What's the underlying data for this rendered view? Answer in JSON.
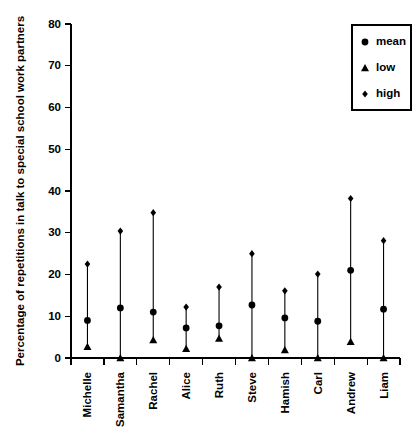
{
  "chart_data": {
    "type": "scatter",
    "title": "",
    "xlabel": "",
    "ylabel": "Percentage of repetitions in talk to special school work partners",
    "ylim": [
      0,
      80
    ],
    "yticks": [
      0,
      10,
      20,
      30,
      40,
      50,
      60,
      70,
      80
    ],
    "grid": false,
    "legend_position": "top-right",
    "categories": [
      "Michelle",
      "Samantha",
      "Rachel",
      "Alice",
      "Ruth",
      "Steve",
      "Hamish",
      "Carl",
      "Andrew",
      "Liam"
    ],
    "series": [
      {
        "name": "mean",
        "marker": "circle",
        "values": [
          9.0,
          12.0,
          11.0,
          7.2,
          7.7,
          12.7,
          9.6,
          8.8,
          21.0,
          11.7
        ]
      },
      {
        "name": "low",
        "marker": "triangle",
        "values": [
          2.7,
          0.0,
          4.3,
          2.2,
          4.7,
          0.0,
          1.9,
          0.0,
          3.9,
          0.0
        ]
      },
      {
        "name": "high",
        "marker": "diamond",
        "values": [
          22.5,
          30.4,
          34.8,
          12.2,
          17.0,
          25.0,
          16.1,
          20.1,
          38.2,
          28.1
        ]
      }
    ]
  },
  "legend": {
    "entries": [
      {
        "label": "mean",
        "marker": "circle"
      },
      {
        "label": "low",
        "marker": "triangle"
      },
      {
        "label": "high",
        "marker": "diamond"
      }
    ]
  }
}
